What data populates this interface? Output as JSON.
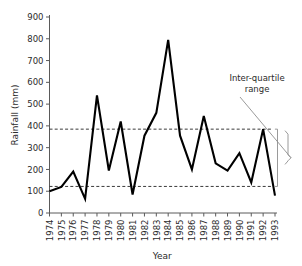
{
  "chart_data": {
    "type": "line",
    "title": "",
    "xlabel": "Year",
    "ylabel": "Rainfall (mm)",
    "x": [
      1974,
      1975,
      1976,
      1977,
      1978,
      1979,
      1980,
      1981,
      1982,
      1983,
      1984,
      1985,
      1986,
      1987,
      1988,
      1989,
      1990,
      1991,
      1992,
      1993
    ],
    "xtick_labels": [
      "1974",
      "1975",
      "1976",
      "1977",
      "1978",
      "1979",
      "1980",
      "1981",
      "1982",
      "1983",
      "1984",
      "1985",
      "1986",
      "1987",
      "1988",
      "1989",
      "1990",
      "1991",
      "1992",
      "1993"
    ],
    "values": [
      100,
      120,
      190,
      65,
      540,
      195,
      420,
      85,
      355,
      460,
      795,
      355,
      200,
      445,
      228,
      195,
      275,
      140,
      385,
      80
    ],
    "ylim": [
      0,
      900
    ],
    "ytick_labels": [
      "0",
      "100",
      "200",
      "300",
      "400",
      "500",
      "600",
      "700",
      "800",
      "900"
    ],
    "yticks": [
      0,
      100,
      200,
      300,
      400,
      500,
      600,
      700,
      800,
      900
    ],
    "xlim": [
      1974,
      1993
    ],
    "grid": false,
    "legend": "none",
    "series": [
      {
        "name": "Rainfall",
        "color": "#000000",
        "values": [
          100,
          120,
          190,
          65,
          540,
          195,
          420,
          85,
          355,
          460,
          795,
          355,
          200,
          445,
          228,
          195,
          275,
          140,
          385,
          80
        ]
      }
    ],
    "reference_lines": [
      {
        "name": "upper-quartile",
        "value": 385,
        "style": "dashed",
        "color": "#3a3a3a"
      },
      {
        "name": "lower-quartile",
        "value": 122,
        "style": "dashed",
        "color": "#3a3a3a"
      }
    ],
    "annotations": [
      {
        "name": "inter-quartile-range",
        "text_line1": "Inter-quartile",
        "text_line2": "range",
        "spans": [
          122,
          385
        ]
      }
    ]
  },
  "annotation": {
    "line1": "Inter-quartile",
    "line2": "range"
  },
  "axes": {
    "y_title": "Rainfall (mm)",
    "x_title": "Year"
  }
}
